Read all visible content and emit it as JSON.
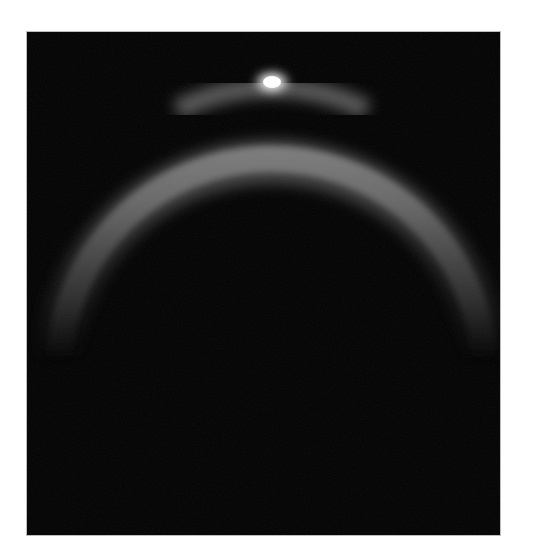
{
  "image": {
    "alt": "Dark field with a faint glowing circular arc (ring segment) and a bright point-like highlight at the top of the arc",
    "background_color": "#ffffff",
    "panel_color": "#020202",
    "arc": {
      "color": "#9a9a9a",
      "center_x": 243,
      "center_y": 270,
      "radius": 215,
      "thickness": 34,
      "visible_span": "upper half, fading out toward both lower ends"
    },
    "highlight": {
      "color": "#ffffff",
      "x": 245,
      "y": 50
    }
  }
}
